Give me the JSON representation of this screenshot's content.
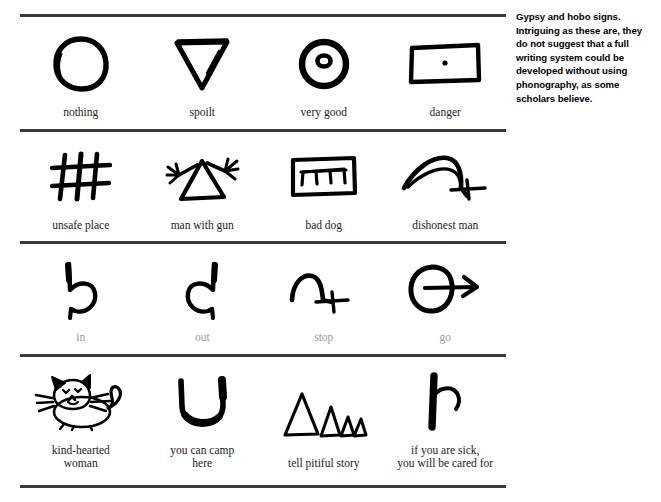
{
  "caption": {
    "text": "Gypsy and hobo signs. Intriguing as these are, they do not suggest that a full writing system could be developed without using phonography, as some scholars believe."
  },
  "table": {
    "rows": [
      {
        "row_id": "row-1",
        "cells": [
          {
            "label": "nothing",
            "icon": "hand-drawn-oval-icon"
          },
          {
            "label": "spoilt",
            "icon": "hand-drawn-down-triangle-icon"
          },
          {
            "label": "very good",
            "icon": "hand-drawn-circle-with-dot-icon"
          },
          {
            "label": "danger",
            "icon": "hand-drawn-rectangle-with-dot-icon"
          }
        ]
      },
      {
        "row_id": "row-2",
        "cells": [
          {
            "label": "unsafe place",
            "icon": "hand-drawn-grid-icon"
          },
          {
            "label": "man with gun",
            "icon": "hand-drawn-triangle-with-arms-icon"
          },
          {
            "label": "bad dog",
            "icon": "hand-drawn-box-with-teeth-icon"
          },
          {
            "label": "dishonest man",
            "icon": "hand-drawn-arc-with-cross-icon"
          }
        ]
      },
      {
        "row_id": "row-3",
        "cells": [
          {
            "label": "in",
            "icon": "hand-drawn-hook-right-icon"
          },
          {
            "label": "out",
            "icon": "hand-drawn-hook-left-icon"
          },
          {
            "label": "stop",
            "icon": "hand-drawn-arch-with-cross-icon"
          },
          {
            "label": "go",
            "icon": "hand-drawn-circle-with-arrow-icon"
          }
        ]
      },
      {
        "row_id": "row-4",
        "cells": [
          {
            "label": "kind-hearted\nwoman",
            "icon": "hand-drawn-cat-icon"
          },
          {
            "label": "you can camp\nhere",
            "icon": "hand-drawn-u-shape-icon"
          },
          {
            "label": "tell pitiful story",
            "icon": "hand-drawn-four-triangles-icon"
          },
          {
            "label": "if you are sick,\nyou will be cared for",
            "icon": "hand-drawn-stroke-with-hook-icon"
          }
        ]
      }
    ]
  },
  "colors": {
    "ink": "#111111",
    "rule": "#3a3a3a",
    "faded_label": "#9a9a9a",
    "background": "#ffffff"
  }
}
